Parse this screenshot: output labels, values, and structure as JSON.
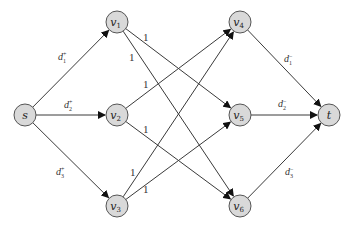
{
  "diagram": {
    "type": "directed-flow-network",
    "colors": {
      "node_fill": "#d9d9d9",
      "node_stroke": "#555555",
      "edge": "#3a3a3a",
      "text": "#222222"
    },
    "nodes": [
      {
        "id": "s",
        "label": "s",
        "sub": "",
        "x": 25,
        "y": 115
      },
      {
        "id": "v1",
        "label": "v",
        "sub": "1",
        "x": 117,
        "y": 22
      },
      {
        "id": "v2",
        "label": "v",
        "sub": "2",
        "x": 117,
        "y": 115
      },
      {
        "id": "v3",
        "label": "v",
        "sub": "3",
        "x": 117,
        "y": 206
      },
      {
        "id": "v4",
        "label": "v",
        "sub": "4",
        "x": 240,
        "y": 22
      },
      {
        "id": "v5",
        "label": "v",
        "sub": "5",
        "x": 240,
        "y": 115
      },
      {
        "id": "v6",
        "label": "v",
        "sub": "6",
        "x": 240,
        "y": 206
      },
      {
        "id": "t",
        "label": "t",
        "sub": "",
        "x": 329,
        "y": 115
      }
    ],
    "edges": [
      {
        "from": "s",
        "to": "v1",
        "label": "d",
        "sub": "1",
        "sup": "+",
        "lx": 58,
        "ly": 60
      },
      {
        "from": "s",
        "to": "v2",
        "label": "d",
        "sub": "2",
        "sup": "+",
        "lx": 64,
        "ly": 108
      },
      {
        "from": "s",
        "to": "v3",
        "label": "d",
        "sub": "3",
        "sup": "+",
        "lx": 56,
        "ly": 175
      },
      {
        "from": "v1",
        "to": "v5",
        "label": "1",
        "sub": "",
        "sup": "",
        "lx": 143,
        "ly": 41
      },
      {
        "from": "v1",
        "to": "v6",
        "label": "1",
        "sub": "",
        "sup": "",
        "lx": 129,
        "ly": 61
      },
      {
        "from": "v2",
        "to": "v4",
        "label": "1",
        "sub": "",
        "sup": "",
        "lx": 143,
        "ly": 88
      },
      {
        "from": "v2",
        "to": "v6",
        "label": "1",
        "sub": "",
        "sup": "",
        "lx": 143,
        "ly": 133
      },
      {
        "from": "v3",
        "to": "v4",
        "label": "1",
        "sub": "",
        "sup": "",
        "lx": 130,
        "ly": 176
      },
      {
        "from": "v3",
        "to": "v5",
        "label": "1",
        "sub": "",
        "sup": "",
        "lx": 143,
        "ly": 193
      },
      {
        "from": "v4",
        "to": "t",
        "label": "d",
        "sub": "1",
        "sup": "−",
        "lx": 284,
        "ly": 62
      },
      {
        "from": "v5",
        "to": "t",
        "label": "d",
        "sub": "2",
        "sup": "−",
        "lx": 278,
        "ly": 107
      },
      {
        "from": "v6",
        "to": "t",
        "label": "d",
        "sub": "3",
        "sup": "−",
        "lx": 285,
        "ly": 175
      }
    ],
    "node_radius": 11
  }
}
